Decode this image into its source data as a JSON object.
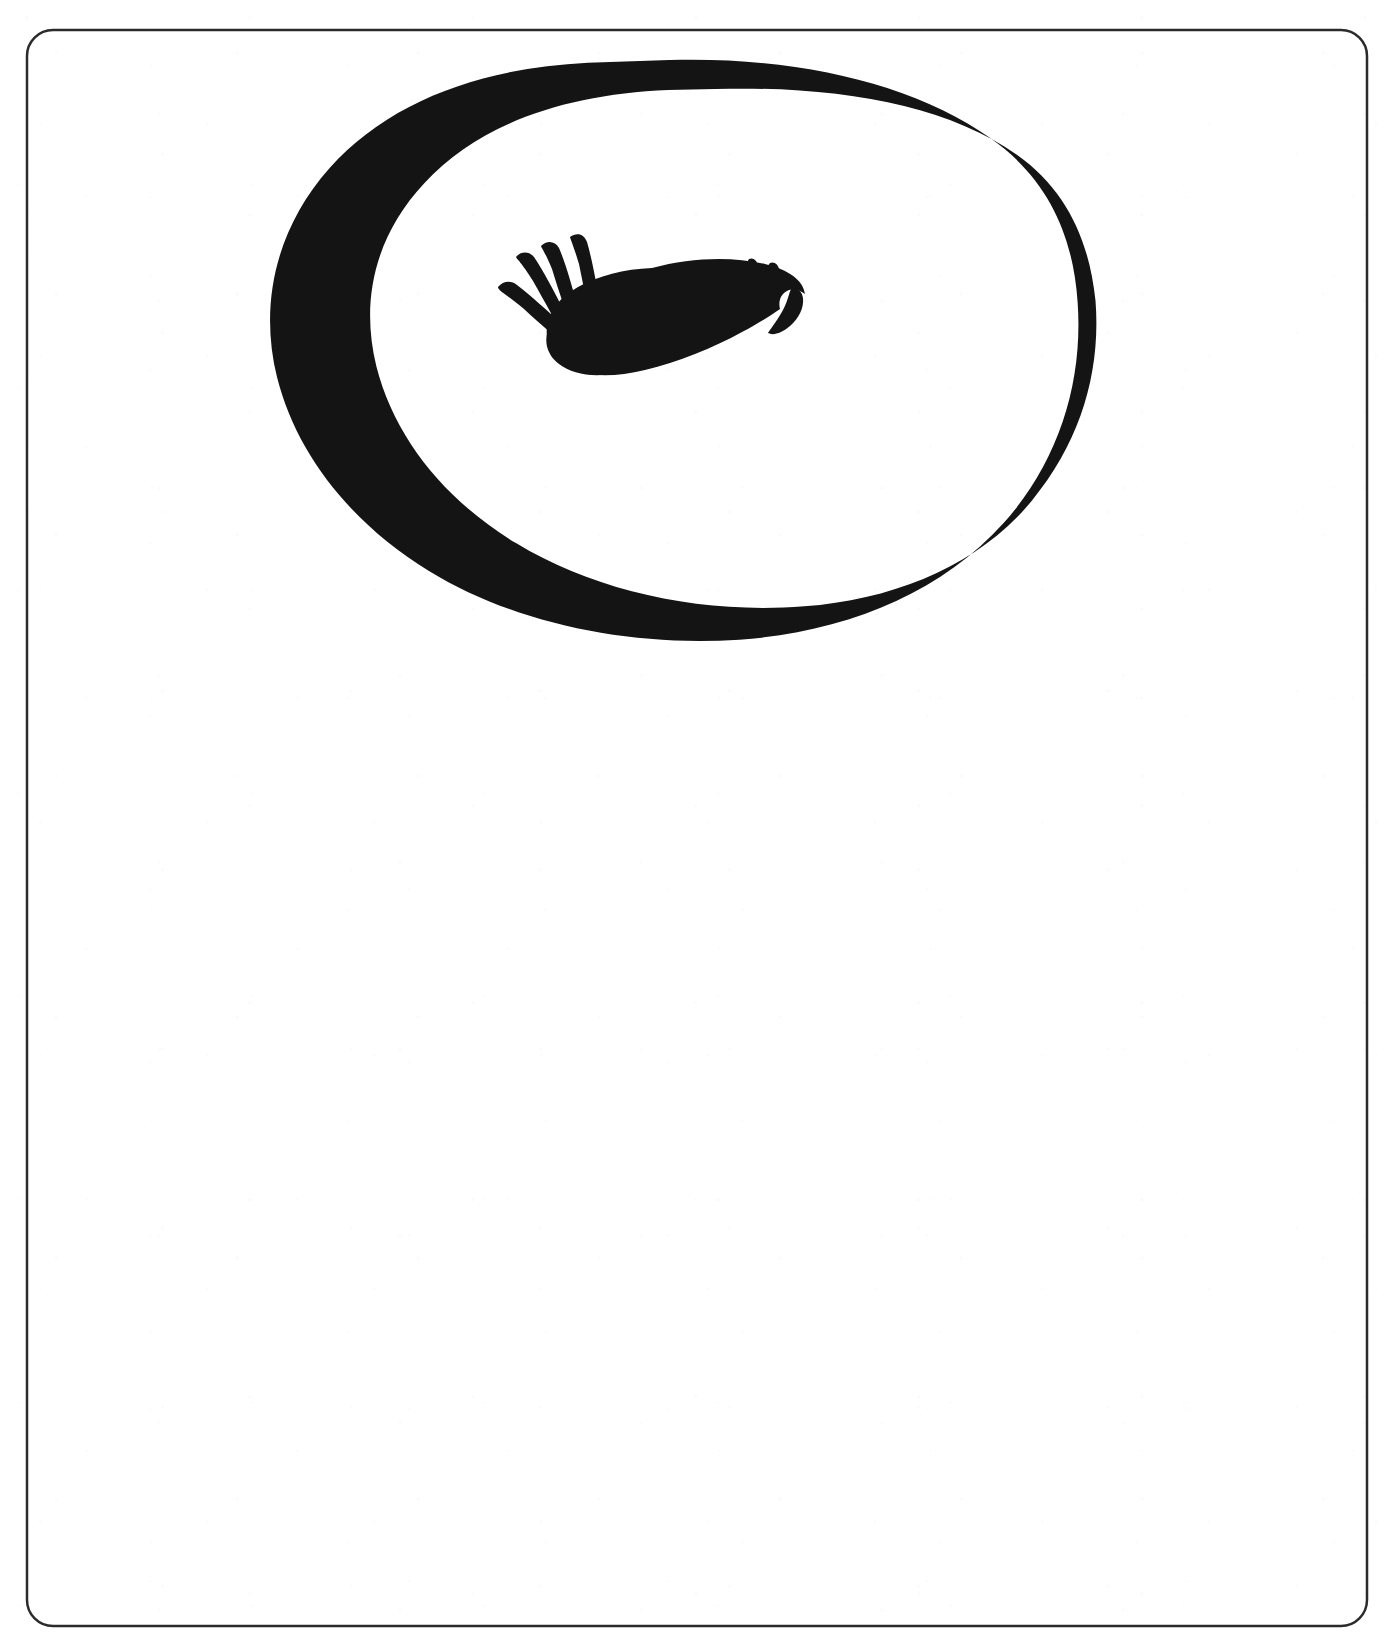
{
  "page": {
    "width": 1386,
    "height": 1643,
    "background_color": "#ffffff",
    "ink_color": "#141414",
    "border_color": "#2b2b2b",
    "caption": ""
  },
  "border": {
    "name": "page-border",
    "shape": "rounded-rectangle",
    "x": 27,
    "y": 30,
    "width": 1340,
    "height": 1596,
    "corner_radius": 26,
    "stroke_width": 2.5,
    "stroke_color": "#2b2b2b",
    "fill": "none"
  },
  "artwork": {
    "name": "ink-drawing",
    "description": "Thick hand-drawn black oval outline enclosing a solid black bird-like figure with four tapered feather strokes fanning to the upper left and two small teardrop marks at the right.",
    "ink_color": "#141414",
    "elements": [
      {
        "name": "oval-outline",
        "type": "ellipse-stroke",
        "center_x": 684,
        "center_y": 350,
        "radius_x": 390,
        "radius_y": 290,
        "stroke_width": 30,
        "rotation_deg": -1.5,
        "color": "#141414"
      },
      {
        "name": "bird-body",
        "type": "solid-blob",
        "bbox": [
          495,
          235,
          805,
          378
        ],
        "color": "#141414"
      },
      {
        "name": "feather-stroke-1",
        "type": "tapered-stroke",
        "order": 1,
        "color": "#141414"
      },
      {
        "name": "feather-stroke-2",
        "type": "tapered-stroke",
        "order": 2,
        "color": "#141414"
      },
      {
        "name": "feather-stroke-3",
        "type": "tapered-stroke",
        "order": 3,
        "color": "#141414"
      },
      {
        "name": "feather-stroke-4",
        "type": "tapered-stroke",
        "order": 4,
        "color": "#141414"
      },
      {
        "name": "teardrop-mark-left",
        "type": "teardrop",
        "cx": 752,
        "cy": 268,
        "color": "#141414"
      },
      {
        "name": "teardrop-mark-right",
        "type": "teardrop",
        "cx": 772,
        "cy": 277,
        "color": "#141414"
      }
    ]
  }
}
